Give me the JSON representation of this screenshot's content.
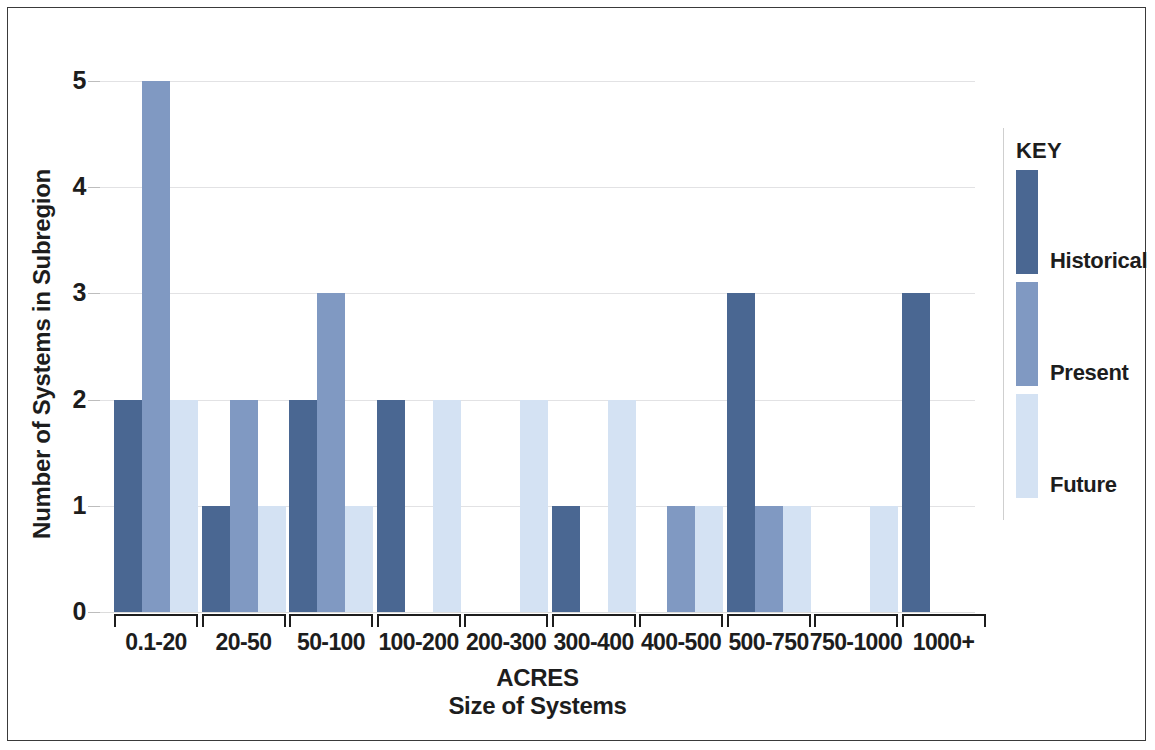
{
  "figure": {
    "frame_color": "#3a3a3a",
    "background": "#ffffff"
  },
  "axes": {
    "y_title": "Number of Systems in Subregion",
    "x_title_line1": "ACRES",
    "x_title_line2": "Size of Systems",
    "y_ticks": [
      "0",
      "1",
      "2",
      "3",
      "4",
      "5"
    ]
  },
  "legend": {
    "title": "KEY",
    "entries": [
      {
        "label": "Historical",
        "color": "#4a6792",
        "key": "historical"
      },
      {
        "label": "Present",
        "color": "#8099c2",
        "key": "present"
      },
      {
        "label": "Future",
        "color": "#d4e2f3",
        "key": "future"
      }
    ]
  },
  "chart_data": {
    "type": "bar",
    "title": "",
    "xlabel": "ACRES / Size of Systems",
    "ylabel": "Number of Systems in Subregion",
    "ylim": [
      0,
      5
    ],
    "yticks": [
      0,
      1,
      2,
      3,
      4,
      5
    ],
    "grid": true,
    "legend_position": "right",
    "grouping": "grouped",
    "categories": [
      "0.1-20",
      "20-50",
      "50-100",
      "100-200",
      "200-300",
      "300-400",
      "400-500",
      "500-750",
      "750-1000",
      "1000+"
    ],
    "series": [
      {
        "name": "Historical",
        "color": "#4a6792",
        "values": [
          2,
          1,
          2,
          2,
          0,
          1,
          0,
          3,
          0,
          3
        ]
      },
      {
        "name": "Present",
        "color": "#8099c2",
        "values": [
          5,
          2,
          3,
          0,
          0,
          0,
          1,
          1,
          0,
          0
        ]
      },
      {
        "name": "Future",
        "color": "#d4e2f3",
        "values": [
          2,
          1,
          1,
          2,
          2,
          2,
          1,
          1,
          1,
          0
        ]
      }
    ]
  }
}
